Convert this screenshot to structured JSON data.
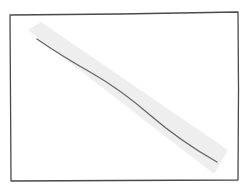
{
  "sketch": {
    "description": "Hand-drawn rectangle frame with a descending diagonal line and a light highlight band",
    "frame": {
      "points": "10,15 238,12 238,180 11,181",
      "stroke": "#4a4a4a"
    },
    "highlight_band": {
      "points": "28,28 40,24 226,150 214,172",
      "fill": "#ececec"
    },
    "diagonal_line": {
      "x1": 37,
      "y1": 39,
      "x2": 217,
      "y2": 162,
      "stroke": "#6a6a6a"
    }
  }
}
